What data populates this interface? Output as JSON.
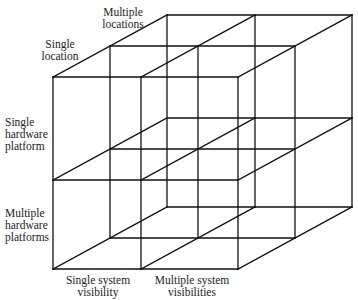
{
  "diagram": {
    "type": "3d-cube-matrix",
    "stroke_color": "#111111",
    "background": "#ffffff",
    "axes": {
      "depth": {
        "near_label": [
          "Single",
          "location"
        ],
        "far_label": [
          "Multiple",
          "locations"
        ]
      },
      "vertical": {
        "top_label": [
          "Single",
          "hardware",
          "platform"
        ],
        "bottom_label": [
          "Multiple",
          "hardware",
          "platforms"
        ]
      },
      "horizontal": {
        "left_label": [
          "Single system",
          "visibility"
        ],
        "right_label": [
          "Multiple system",
          "visibilities"
        ]
      }
    },
    "cells": 8
  }
}
